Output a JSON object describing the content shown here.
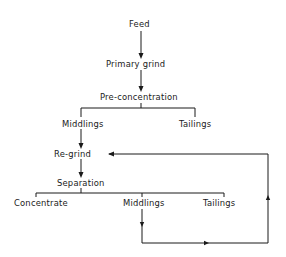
{
  "diagram": {
    "type": "flowchart",
    "nodes": {
      "feed": "Feed",
      "primary_grind": "Primary grind",
      "pre_concentration": "Pre-concentration",
      "middlings_1": "Middlings",
      "tailings_1": "Tailings",
      "regrind": "Re-grind",
      "separation": "Separation",
      "concentrate": "Concentrate",
      "middlings_2": "Middlings",
      "tailings_2": "Tailings"
    },
    "edges": [
      {
        "from": "Feed",
        "to": "Primary grind"
      },
      {
        "from": "Primary grind",
        "to": "Pre-concentration"
      },
      {
        "from": "Pre-concentration",
        "to": "Middlings"
      },
      {
        "from": "Pre-concentration",
        "to": "Tailings"
      },
      {
        "from": "Middlings",
        "to": "Re-grind"
      },
      {
        "from": "Re-grind",
        "to": "Separation"
      },
      {
        "from": "Separation",
        "to": "Concentrate"
      },
      {
        "from": "Separation",
        "to": "Middlings"
      },
      {
        "from": "Separation",
        "to": "Tailings"
      },
      {
        "from": "Middlings (separation)",
        "to": "Re-grind",
        "note": "recycle loop"
      }
    ]
  }
}
